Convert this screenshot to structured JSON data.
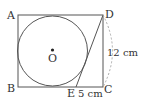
{
  "figure": {
    "points": {
      "A": "A",
      "B": "B",
      "C": "C",
      "D": "D",
      "E": "E",
      "O": "O"
    },
    "dimensions": {
      "DC": "12 cm",
      "EC": "5 cm"
    },
    "colors": {
      "line": "#555555",
      "arc": "#aaaaaa",
      "text": "#333333"
    }
  }
}
